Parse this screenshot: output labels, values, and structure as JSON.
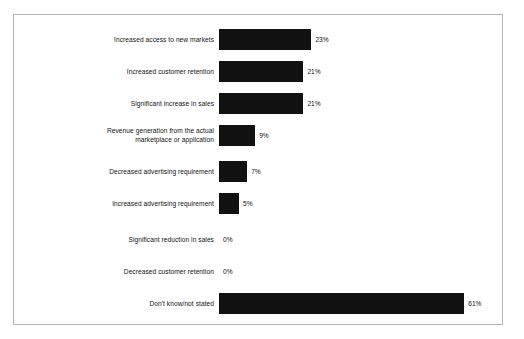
{
  "figure": {
    "background_color": "#ffffff",
    "frame_color": "#b5b5b5",
    "bar_color": "#111111",
    "text_color": "#121212"
  },
  "chart_data": {
    "type": "bar",
    "orientation": "horizontal",
    "title": "",
    "subtitle": "",
    "xlabel": "",
    "ylabel": "",
    "xlim": [
      0,
      61
    ],
    "grid": false,
    "legend": null,
    "value_suffix": "%",
    "categories": [
      "Increased access to new markets",
      "Increased customer retention",
      "Significant increase in sales",
      "Revenue generation from the actual\nmarketplace or application",
      "Decreased advertising requirement",
      "Increased advertising requirement",
      "Significant reduction in sales",
      "Decreased customer retention",
      "Don't know/not stated"
    ],
    "values": [
      23,
      21,
      21,
      9,
      7,
      5,
      0,
      0,
      61
    ],
    "value_labels": [
      "23%",
      "21%",
      "21%",
      "9%",
      "7%",
      "5%",
      "0%",
      "0%",
      "61%"
    ]
  },
  "rows": [
    {
      "label": "Increased access to new markets",
      "label_lines": [
        "Increased access to new markets"
      ],
      "value": 23,
      "value_label": "23%"
    },
    {
      "label": "Increased customer retention",
      "label_lines": [
        "Increased customer retention"
      ],
      "value": 21,
      "value_label": "21%"
    },
    {
      "label": "Significant increase in sales",
      "label_lines": [
        "Significant increase in sales"
      ],
      "value": 21,
      "value_label": "21%"
    },
    {
      "label": "Revenue generation from the actual marketplace or application",
      "label_lines": [
        "Revenue generation from the actual",
        "marketplace or application"
      ],
      "value": 9,
      "value_label": "9%"
    },
    {
      "label": "Decreased advertising requirement",
      "label_lines": [
        "Decreased advertising requirement"
      ],
      "value": 7,
      "value_label": "7%"
    },
    {
      "label": "Increased advertising requirement",
      "label_lines": [
        "Increased advertising requirement"
      ],
      "value": 5,
      "value_label": "5%"
    },
    {
      "label": "Significant reduction in sales",
      "label_lines": [
        "Significant reduction in sales"
      ],
      "value": 0,
      "value_label": "0%"
    },
    {
      "label": "Decreased customer retention",
      "label_lines": [
        "Decreased customer retention"
      ],
      "value": 0,
      "value_label": "0%"
    },
    {
      "label": "Don't know/not stated",
      "label_lines": [
        "Don't know/not stated"
      ],
      "value": 61,
      "value_label": "61%"
    }
  ],
  "layout": {
    "row_tops": [
      14,
      46,
      78,
      110,
      146,
      178,
      214,
      246,
      278
    ],
    "px_per_unit": 4.02
  }
}
